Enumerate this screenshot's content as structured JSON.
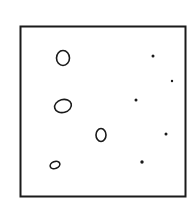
{
  "diagram": {
    "stroke_color": "#1a1a1a",
    "background": "#ffffff",
    "frame": {
      "x": 20.5,
      "y": 26.5,
      "width": 165,
      "height": 170
    },
    "rings": [
      {
        "cx": 63,
        "cy": 58,
        "rx": 6.5,
        "ry": 7.5,
        "rot": 0
      },
      {
        "cx": 63,
        "cy": 106,
        "rx": 8.5,
        "ry": 6.5,
        "rot": -15
      },
      {
        "cx": 101,
        "cy": 135,
        "rx": 5,
        "ry": 6.5,
        "rot": 0
      },
      {
        "cx": 55,
        "cy": 165,
        "rx": 5,
        "ry": 3.5,
        "rot": -20
      }
    ],
    "dots": [
      {
        "cx": 153,
        "cy": 56,
        "r": 1.5
      },
      {
        "cx": 172,
        "cy": 81,
        "r": 1.2
      },
      {
        "cx": 136,
        "cy": 100,
        "r": 1.5
      },
      {
        "cx": 166,
        "cy": 134,
        "r": 1.5
      },
      {
        "cx": 142,
        "cy": 162,
        "r": 1.7
      }
    ]
  }
}
